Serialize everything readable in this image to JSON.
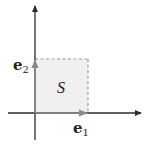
{
  "figure": {
    "colors": {
      "axis": "#2a2a2a",
      "vector": "#8a8a8a",
      "square_fill": "#f0f0f0",
      "square_border": "#9a9a9a",
      "text": "#222222"
    },
    "labels": {
      "e2_base": "e",
      "e2_sub": "2",
      "e1_base": "e",
      "e1_sub": "1",
      "region": "S"
    }
  }
}
